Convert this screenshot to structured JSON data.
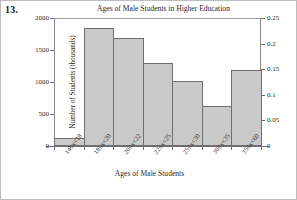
{
  "problem_number": "13.",
  "chart_data": {
    "type": "bar",
    "title": "Ages of Male Students in Higher Education",
    "xlabel": "Ages of Male Students",
    "ylabel": "Number of Students (thousands)",
    "ylabel_secondary": "Relative Frequency Density",
    "categories": [
      "14≤x<18",
      "18≤x<20",
      "20≤x<22",
      "22≤x<25",
      "25≤x<30",
      "30≤x<35",
      "35≤x<60"
    ],
    "values": [
      130,
      1850,
      1690,
      1300,
      1010,
      620,
      1180
    ],
    "values_secondary": [
      0.016,
      0.231,
      0.211,
      0.163,
      0.126,
      0.078,
      0.148
    ],
    "ylim": [
      0,
      2000
    ],
    "ylim_secondary": [
      0,
      0.25
    ],
    "yticks": [
      "0",
      "500",
      "1000",
      "1500",
      "2000"
    ],
    "ytick_values": [
      0,
      500,
      1000,
      1500,
      2000
    ],
    "yticks_secondary": [
      "0",
      "0.05",
      "0.1",
      "0.15",
      "0.2",
      "0.25"
    ],
    "ytick_values_secondary": [
      0,
      0.05,
      0.1,
      0.15,
      0.2,
      0.25
    ],
    "grid": false,
    "legend": "none",
    "bar_fill_color": "#c9c9c9",
    "bar_edge_color": "#6f6f6f"
  }
}
